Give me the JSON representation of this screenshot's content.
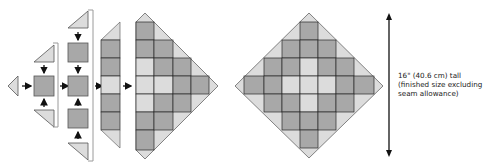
{
  "colors": {
    "dark": "#a8a8a8",
    "light": "#dcdcdc",
    "stroke": "#2a2a2a",
    "bracket": "#9a9a9a",
    "arrow": "#111111"
  },
  "steps": [
    {
      "name": "step-1",
      "pieces": [
        "left triangle",
        "center square",
        "top triangle",
        "bottom triangle"
      ]
    },
    {
      "name": "step-2",
      "pieces": [
        "top triangle",
        "square",
        "square",
        "square",
        "bottom triangle"
      ]
    },
    {
      "name": "step-3",
      "pieces": [
        "top triangle",
        "6 squares",
        "bottom triangle"
      ]
    },
    {
      "name": "step-4",
      "pieces": [
        "half-diamond assembly"
      ]
    }
  ],
  "final_block": {
    "grid_size": 5,
    "pattern": [
      [
        "D",
        "D",
        "D",
        "D",
        "D"
      ],
      [
        "D",
        "D",
        "L",
        "D",
        "D"
      ],
      [
        "D",
        "L",
        "L",
        "L",
        "D"
      ],
      [
        "D",
        "D",
        "L",
        "D",
        "D"
      ],
      [
        "D",
        "D",
        "D",
        "D",
        "D"
      ]
    ]
  },
  "dimension": {
    "line1": "16\" (40.6 cm) tall",
    "line2": "(finished size excluding",
    "line3": "seam allowance)"
  }
}
